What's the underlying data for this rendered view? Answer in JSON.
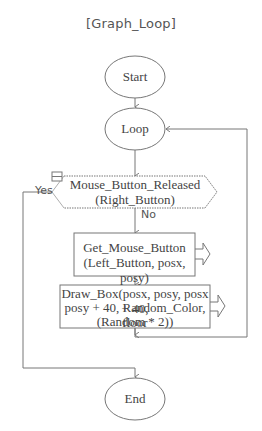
{
  "title": "[Graph_Loop]",
  "nodes": {
    "start": {
      "label": "Start",
      "shape": "ellipse"
    },
    "loop": {
      "label": "Loop",
      "shape": "ellipse"
    },
    "decision": {
      "line1": "Mouse_Button_Released",
      "line2": "(Right_Button)",
      "shape": "hexagon"
    },
    "get_mouse": {
      "line1": "Get_Mouse_Button",
      "line2": "(Left_Button, posx, posy)",
      "shape": "rect"
    },
    "draw_box": {
      "line1": "Draw_Box(posx, posy, posx + 40,",
      "line2": "posy + 40, Random_Color, floor",
      "line3": "(Random * 2))",
      "shape": "rect"
    },
    "end": {
      "label": "End",
      "shape": "ellipse"
    }
  },
  "edges": {
    "yes_label": "Yes",
    "no_label": "No"
  },
  "colors": {
    "stroke": "#777777",
    "text": "#444444",
    "background": "#ffffff"
  }
}
